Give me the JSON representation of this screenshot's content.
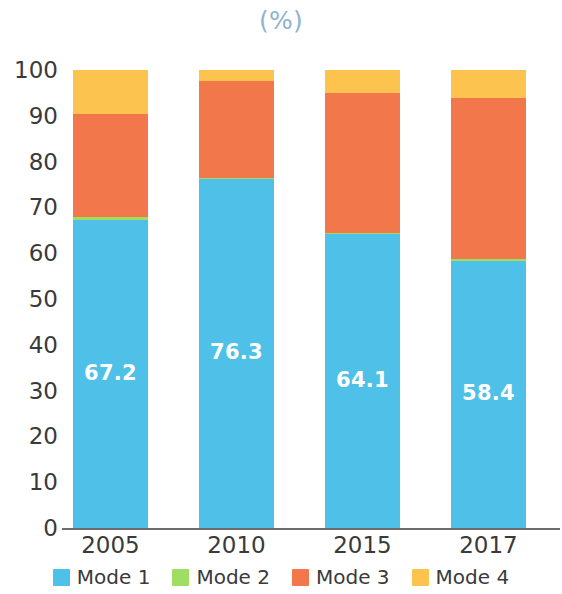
{
  "chart_data": {
    "type": "bar",
    "subtype": "stacked-percentage",
    "title": "",
    "unit_label": "(%)",
    "categories": [
      "2005",
      "2010",
      "2015",
      "2017"
    ],
    "series": [
      {
        "name": "Mode 1",
        "color": "#4fc0e8",
        "values": [
          67.2,
          76.3,
          64.1,
          58.4
        ],
        "labels": [
          "67.2",
          "76.3",
          "64.1",
          "58.4"
        ]
      },
      {
        "name": "Mode 2",
        "color": "#9ede62",
        "values": [
          0.8,
          0.2,
          0.3,
          0.3
        ],
        "labels": [
          "",
          "",
          "",
          ""
        ]
      },
      {
        "name": "Mode 3",
        "color": "#f2784b",
        "values": [
          22.5,
          21.0,
          30.6,
          35.3
        ],
        "labels": [
          "",
          "",
          "",
          ""
        ]
      },
      {
        "name": "Mode 4",
        "color": "#fcc44f",
        "values": [
          9.5,
          2.5,
          5.0,
          6.0
        ],
        "labels": [
          "",
          "",
          "",
          ""
        ]
      }
    ],
    "xlabel": "",
    "ylabel": "",
    "ylim": [
      0,
      100
    ],
    "yticks": [
      0,
      10,
      20,
      30,
      40,
      50,
      60,
      70,
      80,
      90,
      100
    ],
    "ytick_labels": [
      "0",
      "10",
      "20",
      "30",
      "40",
      "50",
      "60",
      "70",
      "80",
      "90",
      "100"
    ],
    "grid": false,
    "legend_position": "bottom",
    "axis_color": "#6d6d6d",
    "tick_text_color": "#3a3a3a",
    "title_color": "#8fb4d0",
    "data_label_color": "#ffffff"
  },
  "legend": {
    "items": [
      {
        "label": "Mode 1",
        "color": "#4fc0e8"
      },
      {
        "label": "Mode 2",
        "color": "#9ede62"
      },
      {
        "label": "Mode 3",
        "color": "#f2784b"
      },
      {
        "label": "Mode 4",
        "color": "#fcc44f"
      }
    ]
  }
}
